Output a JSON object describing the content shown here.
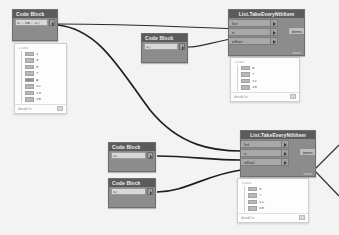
{
  "app": {
    "canvas_name": "dynamo-graph-canvas"
  },
  "nodes": {
    "code_block_1": {
      "title": "Code Block",
      "code": "1..10..2;",
      "output_port": "out-port"
    },
    "code_block_2": {
      "title": "Code Block",
      "code": "2;",
      "output_port": "out-port"
    },
    "code_block_3": {
      "title": "Code Block",
      "code": "2;",
      "output_port": "out-port"
    },
    "code_block_4": {
      "title": "Code Block",
      "code": "1;",
      "output_port": "out-port"
    },
    "take_nth_1": {
      "title": "List.TakeEveryNthItem",
      "inputs": [
        "list",
        "n",
        "offset"
      ],
      "outputs": [
        "items"
      ],
      "footer": "items"
    },
    "take_nth_2": {
      "title": "List.TakeEveryNthItem",
      "inputs": [
        "list",
        "n",
        "offset"
      ],
      "outputs": [
        "items"
      ],
      "footer": "items"
    }
  },
  "previews": {
    "preview_1": {
      "title": "List",
      "items": [
        {
          "value": "1",
          "selected": false
        },
        {
          "value": "3",
          "selected": false
        },
        {
          "value": "5",
          "selected": false
        },
        {
          "value": "7",
          "selected": false
        },
        {
          "value": "9",
          "selected": true
        },
        {
          "value": "11",
          "selected": false
        },
        {
          "value": "13",
          "selected": false
        },
        {
          "value": "15",
          "selected": false
        }
      ],
      "footer": "double"
    },
    "preview_2": {
      "title": "List",
      "items": [
        {
          "value": "5",
          "selected": false
        },
        {
          "value": "7",
          "selected": false
        },
        {
          "value": "11",
          "selected": false
        },
        {
          "value": "15",
          "selected": false
        }
      ],
      "footer": "double"
    },
    "preview_3": {
      "title": "List",
      "items": [
        {
          "value": "3",
          "selected": false
        },
        {
          "value": "7",
          "selected": false
        },
        {
          "value": "11",
          "selected": false
        },
        {
          "value": "15",
          "selected": false
        }
      ],
      "footer": "double"
    }
  },
  "colors": {
    "canvas_bg": "#f3f3f3",
    "node_body": "#8c8c8c",
    "node_header": "#5b5b5b",
    "wire": "#1f1f1f",
    "port_label": "#a8a8a8"
  }
}
